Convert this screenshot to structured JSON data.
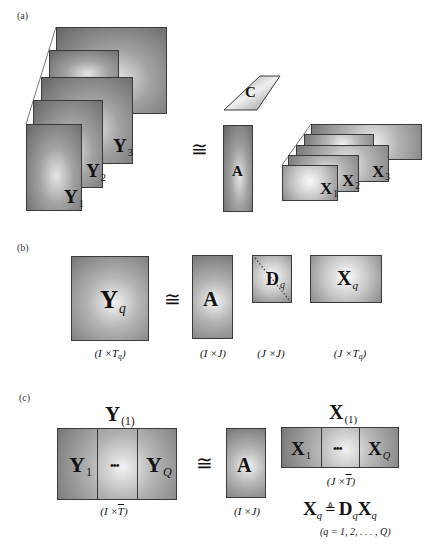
{
  "panel_a": {
    "label": "(a)",
    "approx": "≅",
    "tensor_Y_slices": [
      {
        "symbol": "Y",
        "sub": "1"
      },
      {
        "symbol": "Y",
        "sub": "2"
      },
      {
        "symbol": "Y",
        "sub": "3"
      }
    ],
    "factor_A": {
      "symbol": "A"
    },
    "factor_C": {
      "symbol": "C"
    },
    "tensor_X_slices": [
      {
        "symbol": "X",
        "sub": "1"
      },
      {
        "symbol": "X",
        "sub": "2"
      },
      {
        "symbol": "X",
        "sub": "3"
      }
    ]
  },
  "panel_b": {
    "label": "(b)",
    "approx": "≅",
    "Y": {
      "symbol": "Y",
      "sub": "q"
    },
    "A": {
      "symbol": "A"
    },
    "D": {
      "symbol": "D",
      "sub": "q"
    },
    "X": {
      "symbol": "X",
      "sub": "q"
    },
    "dims": [
      {
        "pre": "(I ×T",
        "sub": "q",
        "post": ")"
      },
      {
        "pre": "(I ×J)",
        "sub": "",
        "post": ""
      },
      {
        "pre": "(J ×J)",
        "sub": "",
        "post": ""
      },
      {
        "pre": "(J ×T",
        "sub": "q",
        "post": ")"
      }
    ]
  },
  "panel_c": {
    "label": "(c)",
    "approx": "≅",
    "Y_unfolded": {
      "symbol": "Y",
      "sub": "(1)"
    },
    "Y_blocks": [
      {
        "symbol": "Y",
        "sub": "1"
      },
      {
        "symbol": "•••",
        "sub": ""
      },
      {
        "symbol": "Y",
        "sub": "Q"
      }
    ],
    "Y_dims": {
      "pre": "(I ×",
      "bar": "T",
      "post": ")"
    },
    "A": {
      "symbol": "A"
    },
    "A_dims": "(I ×J)",
    "X_unfolded": {
      "symbol": "X",
      "sub": "(1)"
    },
    "X_blocks": [
      {
        "symbol": "X",
        "sub": "1"
      },
      {
        "symbol": "•••",
        "sub": ""
      },
      {
        "symbol": "X",
        "sub": "Q"
      }
    ],
    "X_dims": {
      "pre": "(J ×",
      "bar": "T",
      "post": ")"
    },
    "formula": {
      "lhs": "X",
      "lhs_sub": "q",
      "op": "≜",
      "rhs1": "D",
      "rhs1_sub": "q",
      "rhs2": "X",
      "rhs2_sub": "q"
    },
    "range": "(q = 1, 2, . . . , Q)"
  }
}
